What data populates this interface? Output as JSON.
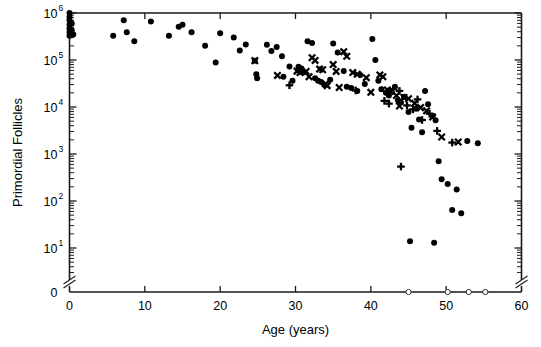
{
  "chart_data": {
    "type": "scatter",
    "title": "",
    "xlabel": "Age (years)",
    "ylabel": "Primordial Follicles",
    "xlim": [
      0,
      60
    ],
    "ylim_log": [
      1,
      1000000
    ],
    "yscale": "log",
    "y_axis_break": true,
    "y_zero_label": "0",
    "grid": false,
    "legend": "none",
    "xticks": [
      0,
      10,
      20,
      30,
      40,
      50,
      60
    ],
    "xtick_labels": [
      "0",
      "10",
      "20",
      "30",
      "40",
      "50",
      "60"
    ],
    "yticks": [
      1000000,
      100000,
      10000,
      1000,
      100,
      10,
      0
    ],
    "ytick_labels": [
      "10^6",
      "10^5",
      "10^4",
      "10^3",
      "10^2",
      "10^1",
      "0"
    ],
    "ytick_mantissa": [
      "10",
      "10",
      "10",
      "10",
      "10",
      "10",
      "0"
    ],
    "ytick_exponent": [
      "6",
      "5",
      "4",
      "3",
      "2",
      "1",
      ""
    ],
    "series": [
      {
        "name": "filled-circle",
        "marker": "circle",
        "points": [
          [
            0.0,
            1000000
          ],
          [
            0.0,
            820000
          ],
          [
            0.0,
            700000
          ],
          [
            0.0,
            560000
          ],
          [
            0.0,
            470000
          ],
          [
            0.0,
            390000
          ],
          [
            0.0,
            330000
          ],
          [
            0.3,
            600000
          ],
          [
            0.3,
            430000
          ],
          [
            0.5,
            350000
          ],
          [
            5.8,
            330000
          ],
          [
            7.2,
            700000
          ],
          [
            7.6,
            390000
          ],
          [
            8.6,
            250000
          ],
          [
            10.8,
            660000
          ],
          [
            13.2,
            330000
          ],
          [
            14.5,
            510000
          ],
          [
            15.0,
            560000
          ],
          [
            16.2,
            390000
          ],
          [
            18.0,
            200000
          ],
          [
            19.4,
            88000
          ],
          [
            20.0,
            370000
          ],
          [
            21.8,
            300000
          ],
          [
            22.6,
            160000
          ],
          [
            23.4,
            215000
          ],
          [
            24.6,
            96000
          ],
          [
            24.8,
            50000
          ],
          [
            24.9,
            41000
          ],
          [
            26.2,
            210000
          ],
          [
            26.8,
            155000
          ],
          [
            27.5,
            190000
          ],
          [
            28.2,
            120000
          ],
          [
            28.4,
            44000
          ],
          [
            29.2,
            73000
          ],
          [
            29.6,
            36000
          ],
          [
            30.4,
            72000
          ],
          [
            30.8,
            66000
          ],
          [
            31.0,
            54000
          ],
          [
            31.6,
            250000
          ],
          [
            32.2,
            230000
          ],
          [
            32.6,
            41000
          ],
          [
            33.0,
            36000
          ],
          [
            33.4,
            34000
          ],
          [
            33.8,
            30000
          ],
          [
            34.6,
            38000
          ],
          [
            35.0,
            225000
          ],
          [
            35.6,
            145000
          ],
          [
            36.4,
            58000
          ],
          [
            36.8,
            27000
          ],
          [
            37.4,
            25500
          ],
          [
            38.2,
            22000
          ],
          [
            38.6,
            48000
          ],
          [
            39.2,
            31000
          ],
          [
            40.2,
            280000
          ],
          [
            40.6,
            100000
          ],
          [
            41.0,
            36000
          ],
          [
            41.4,
            24000
          ],
          [
            42.0,
            20000
          ],
          [
            42.4,
            17500
          ],
          [
            43.2,
            27000
          ],
          [
            43.6,
            14000
          ],
          [
            44.0,
            12500
          ],
          [
            44.4,
            16500
          ],
          [
            45.0,
            7800
          ],
          [
            45.4,
            3600
          ],
          [
            46.0,
            9200
          ],
          [
            46.4,
            5400
          ],
          [
            46.8,
            2900
          ],
          [
            47.2,
            22000
          ],
          [
            47.6,
            11500
          ],
          [
            48.2,
            6400
          ],
          [
            48.6,
            5200
          ],
          [
            49.0,
            700
          ],
          [
            49.4,
            290
          ],
          [
            50.2,
            230
          ],
          [
            50.8,
            64
          ],
          [
            51.4,
            175
          ],
          [
            52.0,
            55
          ],
          [
            52.8,
            1900
          ],
          [
            54.2,
            1700
          ],
          [
            45.2,
            14
          ],
          [
            48.4,
            13
          ]
        ]
      },
      {
        "name": "x-cross",
        "marker": "x",
        "points": [
          [
            24.6,
            97000
          ],
          [
            27.6,
            47000
          ],
          [
            30.2,
            58000
          ],
          [
            30.6,
            54000
          ],
          [
            31.4,
            57000
          ],
          [
            31.8,
            44000
          ],
          [
            32.2,
            112000
          ],
          [
            32.6,
            98000
          ],
          [
            33.2,
            64000
          ],
          [
            33.6,
            62000
          ],
          [
            34.0,
            31000
          ],
          [
            34.2,
            28500
          ],
          [
            35.0,
            80000
          ],
          [
            35.4,
            57000
          ],
          [
            35.8,
            26000
          ],
          [
            36.4,
            150000
          ],
          [
            36.8,
            120000
          ],
          [
            37.6,
            54000
          ],
          [
            38.2,
            50000
          ],
          [
            39.4,
            42000
          ],
          [
            40.0,
            20500
          ],
          [
            41.2,
            48000
          ],
          [
            41.6,
            44000
          ],
          [
            42.2,
            23000
          ],
          [
            42.6,
            21500
          ],
          [
            43.4,
            17500
          ],
          [
            43.8,
            10500
          ],
          [
            44.4,
            16000
          ],
          [
            45.0,
            15000
          ],
          [
            45.8,
            12000
          ],
          [
            46.6,
            9700
          ],
          [
            47.4,
            8300
          ],
          [
            48.2,
            6100
          ],
          [
            49.4,
            2300
          ],
          [
            51.6,
            1800
          ]
        ]
      },
      {
        "name": "plus-cross",
        "marker": "plus",
        "points": [
          [
            29.2,
            29000
          ],
          [
            38.0,
            22500
          ],
          [
            41.8,
            13500
          ],
          [
            42.4,
            11800
          ],
          [
            43.0,
            24000
          ],
          [
            43.8,
            22000
          ],
          [
            44.8,
            10800
          ],
          [
            45.6,
            8900
          ],
          [
            46.2,
            14500
          ],
          [
            46.8,
            5300
          ],
          [
            47.8,
            7200
          ],
          [
            48.8,
            3100
          ],
          [
            50.8,
            1750
          ],
          [
            44.0,
            540
          ]
        ]
      },
      {
        "name": "open-circle",
        "marker": "open-circle",
        "points": [
          [
            45.0,
            0
          ],
          [
            50.2,
            0
          ],
          [
            53.0,
            0
          ],
          [
            55.2,
            0
          ]
        ]
      }
    ]
  }
}
